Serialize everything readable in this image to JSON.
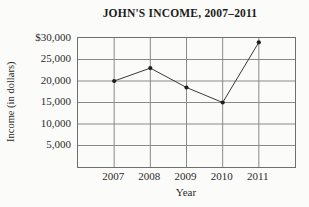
{
  "chart_data": {
    "type": "line",
    "title": "JOHN'S INCOME, 2007–2011",
    "xlabel": "Year",
    "ylabel": "Income (in dollars)",
    "categories": [
      "2007",
      "2008",
      "2009",
      "2010",
      "2011"
    ],
    "values": [
      20000,
      23000,
      18500,
      15000,
      29000
    ],
    "ylim": [
      0,
      30000
    ],
    "y_tick_step": 5000,
    "y_tick_labels": [
      "$30,000",
      "25,000",
      "20,000",
      "15,000",
      "10,000",
      "5,000"
    ],
    "grid": true,
    "legend": "none",
    "marker": "dot",
    "colors": {
      "background": "#fbfbf9",
      "grid_line": "#8a8a8a",
      "plot_border": "#6f6f6f",
      "series_line": "#3a3a3a",
      "marker_fill": "#1e1e1e",
      "text": "#2b2b2b",
      "title_text": "#1c1c1c"
    }
  }
}
